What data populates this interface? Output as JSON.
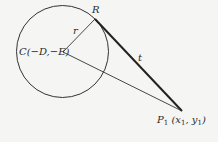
{
  "diagram": {
    "type": "geometry",
    "colors": {
      "background": "#f5f5f4",
      "stroke": "#333333",
      "text": "#2a2a2a"
    },
    "circle": {
      "cx": 62.5,
      "cy": 51.5,
      "r": 46
    },
    "points": {
      "C": {
        "x": 63,
        "y": 52,
        "label": "C(−D,−E)"
      },
      "R": {
        "x": 95,
        "y": 19,
        "label": "R"
      },
      "P1": {
        "x": 182,
        "y": 111,
        "label_main": "P",
        "label_sub": "1",
        "label_coords_open": " (x",
        "label_x_sub": "1",
        "label_comma": ", y",
        "label_y_sub": "1",
        "label_close": ")"
      }
    },
    "segments": [
      {
        "name": "radius",
        "from": "C",
        "to": "R",
        "label": "r"
      },
      {
        "name": "tangent",
        "from": "R",
        "to": "P1",
        "label": "t",
        "bold": true
      },
      {
        "name": "center-to-point",
        "from": "C",
        "to": "P1",
        "label": ""
      }
    ]
  }
}
